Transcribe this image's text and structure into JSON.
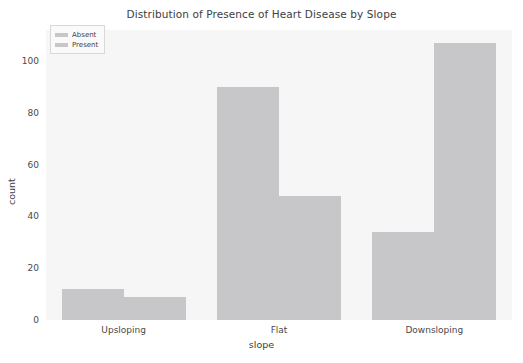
{
  "chart_data": {
    "type": "bar",
    "title": "Distribution of Presence of Heart Disease by Slope",
    "xlabel": "slope",
    "ylabel": "count",
    "categories": [
      "Upsloping",
      "Flat",
      "Downsloping"
    ],
    "series": [
      {
        "name": "Absent",
        "values": [
          12,
          90,
          34
        ],
        "color": "#c7c7c9"
      },
      {
        "name": "Present",
        "values": [
          9,
          48,
          107
        ],
        "color": "#c7c7c9"
      }
    ],
    "yticks": [
      0,
      20,
      40,
      60,
      80,
      100
    ],
    "ylim": [
      0,
      112
    ],
    "grid": false,
    "legend_position": "upper left",
    "plot_background": "#f6f6f7",
    "figure_background": "#ffffff"
  }
}
